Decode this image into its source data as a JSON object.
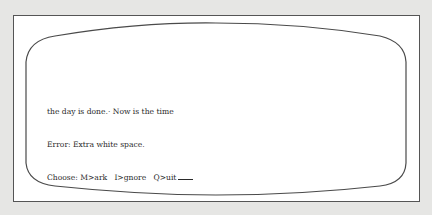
{
  "screen": {
    "lines": [
      "the day is done.· Now is the time",
      "Error: Extra white space."
    ],
    "prompt": {
      "label": "Choose:",
      "options": [
        {
          "key": "M",
          "text": "M>ark"
        },
        {
          "key": "I",
          "text": "I>gnore"
        },
        {
          "key": "Q",
          "text": "Q>uit"
        }
      ]
    }
  },
  "colors": {
    "background": "#e6e6e4",
    "screen": "#ffffff",
    "outline": "#555555",
    "text": "#2a2a2a"
  }
}
